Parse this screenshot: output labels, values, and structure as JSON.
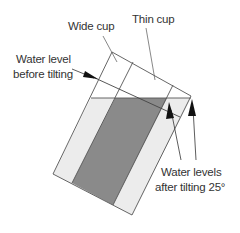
{
  "diagram": {
    "type": "cup-tilting-water-level",
    "labels": {
      "wide_cup": "Wide cup",
      "thin_cup": "Thin cup",
      "before_line1": "Water level",
      "before_line2": "before tilting",
      "after_line1": "Water levels",
      "after_line2": "after tilting 25°"
    },
    "tilt_angle_degrees": 25,
    "colors": {
      "outline": "#555555",
      "wide_cup_water": "#ececec",
      "thin_cup_water": "#8a8a8a",
      "text": "#333333",
      "background": "#ffffff"
    }
  }
}
